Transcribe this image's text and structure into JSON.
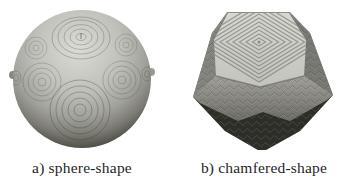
{
  "figure": {
    "background_color": "#ffffff",
    "panels": [
      {
        "id": "a",
        "caption": "a) sphere-shape",
        "render": "sphere-shape-render"
      },
      {
        "id": "b",
        "caption": "b) chamfered-shape",
        "render": "chamfered-shape-render"
      }
    ],
    "colors": {
      "sphere_light": "#dcdcd6",
      "sphere_dark": "#2f2f2a",
      "chamfered_top_face": "#d8d8d3",
      "chamfered_side": "#8e8e88",
      "chamfered_bottom": "#2e2e29",
      "text": "#1f1f1f"
    }
  }
}
